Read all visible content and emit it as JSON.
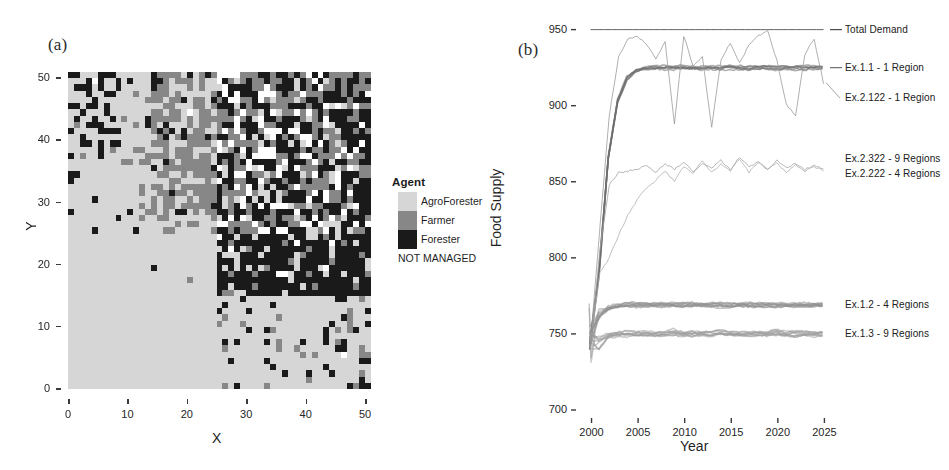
{
  "figure": {
    "panel_a_letter": "(a)",
    "panel_b_letter": "(b)"
  },
  "panel_a": {
    "xlabel": "X",
    "ylabel": "Y",
    "x_ticks": [
      "0",
      "10",
      "20",
      "30",
      "40",
      "50"
    ],
    "y_ticks": [
      "0",
      "10",
      "20",
      "30",
      "40",
      "50"
    ],
    "x_range": [
      0,
      51
    ],
    "y_range": [
      0,
      51
    ],
    "grid_cells": 51,
    "legend": {
      "title": "Agent",
      "items": [
        {
          "label": "AgroForester",
          "color": "#d6d6d6",
          "has_swatch": true
        },
        {
          "label": "Farmer",
          "color": "#878787",
          "has_swatch": true
        },
        {
          "label": "Forester",
          "color": "#1a1a1a",
          "has_swatch": true
        },
        {
          "label": "NOT MANAGED",
          "color": "#ffffff",
          "has_swatch": false
        }
      ]
    }
  },
  "chart_data": {
    "type": "line",
    "title": "",
    "xlabel": "Year",
    "ylabel": "Food Supply",
    "xlim": [
      1999.3,
      2025.6
    ],
    "ylim": [
      700,
      955
    ],
    "x_ticks": [
      2000,
      2005,
      2010,
      2015,
      2020,
      2025
    ],
    "y_ticks": [
      700,
      750,
      800,
      850,
      900,
      950
    ],
    "grid": false,
    "legend_position": "right-inline",
    "series": [
      {
        "name": "Total Demand",
        "color": "#4d4d4d",
        "width": 0.9,
        "style": "flat",
        "label_y": 950,
        "values": [
          950,
          950,
          950,
          950,
          950,
          950,
          950,
          950,
          950,
          950,
          950,
          950,
          950,
          950,
          950,
          950,
          950,
          950,
          950,
          950,
          950,
          950,
          950,
          950,
          950,
          950
        ]
      },
      {
        "name": "Ex.1.1 - 1 Region",
        "color": "#6e6e6e",
        "width": 3.4,
        "style": "thick-plateau",
        "label_y": 925,
        "values": [
          742,
          790,
          866,
          903,
          918,
          923,
          925,
          925,
          925,
          925,
          925,
          925,
          925,
          925,
          925,
          925,
          925,
          925,
          925,
          925,
          925,
          925,
          925,
          925,
          925,
          925
        ]
      },
      {
        "name": "Ex.2.122 - 1 Region",
        "color": "#9a9a9a",
        "width": 0.8,
        "style": "oscillating",
        "label_y": 905,
        "values": [
          745,
          820,
          893,
          932,
          944,
          946,
          940,
          931,
          942,
          888,
          946,
          926,
          932,
          886,
          930,
          941,
          928,
          940,
          946,
          949,
          930,
          901,
          893,
          934,
          944,
          915
        ]
      },
      {
        "name": "Ex.2.322 - 9 Regions",
        "color": "#a5a5a5",
        "width": 0.8,
        "style": "oscillating-mid",
        "label_y": 865,
        "values": [
          742,
          805,
          848,
          856,
          857,
          858,
          861,
          856,
          862,
          858,
          863,
          857,
          862,
          859,
          864,
          858,
          866,
          860,
          863,
          858,
          864,
          859,
          862,
          858,
          861,
          858
        ]
      },
      {
        "name": "Ex.2.222 - 4 Regions",
        "color": "#b0b0b0",
        "width": 0.8,
        "style": "oscillating-mid",
        "label_y": 855,
        "values": [
          744,
          790,
          800,
          815,
          828,
          838,
          846,
          851,
          857,
          850,
          860,
          855,
          864,
          856,
          862,
          857,
          865,
          856,
          863,
          858,
          862,
          856,
          861,
          857,
          860,
          857
        ]
      },
      {
        "name": "Ex.1.2 - 4 Regions",
        "color": "#909090",
        "width": 4.0,
        "style": "bundle",
        "label_y": 769,
        "values": [
          748,
          762,
          767,
          768,
          769,
          769,
          769,
          769,
          769,
          769,
          769,
          769,
          769,
          769,
          769,
          769,
          769,
          769,
          769,
          769,
          769,
          769,
          769,
          769,
          769,
          769
        ]
      },
      {
        "name": "Ex.1.3 - 9 Regions",
        "color": "#9c9c9c",
        "width": 5.0,
        "style": "bundle",
        "label_y": 750,
        "values": [
          745,
          744,
          749,
          750,
          750,
          750,
          750,
          750,
          750,
          751,
          750,
          750,
          750,
          750,
          751,
          750,
          750,
          750,
          750,
          750,
          751,
          750,
          750,
          750,
          750,
          750
        ]
      }
    ]
  }
}
